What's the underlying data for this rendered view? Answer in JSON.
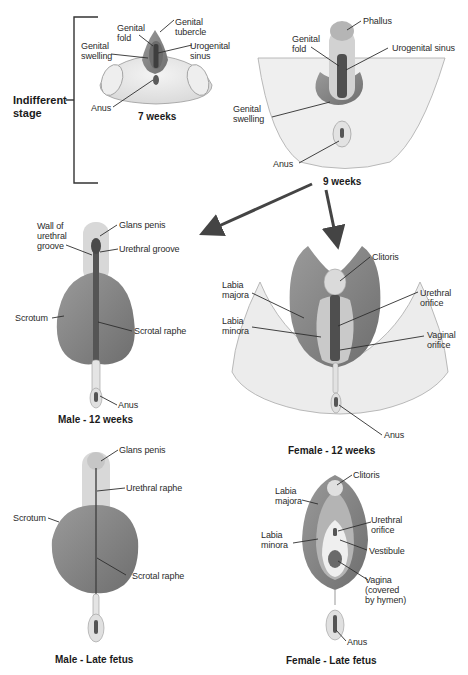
{
  "colors": {
    "background": "#ffffff",
    "skin_light": "#e6e6e6",
    "tissue_mid": "#8a8a8a",
    "tissue_dark": "#5c5c5c",
    "groove": "#3e3e3e",
    "leader_line": "#2e2e2e",
    "text": "#2b2b2b"
  },
  "indifferent_stage": {
    "bracket_label": "Indifferent\nstage",
    "week7": {
      "caption": "7 weeks",
      "labels": {
        "genital_fold": "Genital\nfold",
        "genital_tubercle": "Genital\ntubercle",
        "genital_swelling": "Genital\nswelling",
        "urogenital_sinus": "Urogenital\nsinus",
        "anus": "Anus"
      }
    },
    "week9": {
      "caption": "9 weeks",
      "labels": {
        "phallus": "Phallus",
        "genital_fold": "Genital\nfold",
        "urogenital_sinus": "Urogenital sinus",
        "genital_swelling": "Genital\nswelling",
        "anus": "Anus"
      }
    }
  },
  "male_12_weeks": {
    "caption": "Male - 12 weeks",
    "labels": {
      "glans_penis": "Glans penis",
      "wall_of_urethral_groove": "Wall of\nurethral\ngroove",
      "urethral_groove": "Urethral groove",
      "scrotum": "Scrotum",
      "scrotal_raphe": "Scrotal raphe",
      "anus": "Anus"
    }
  },
  "female_12_weeks": {
    "caption": "Female - 12 weeks",
    "labels": {
      "clitoris": "Clitoris",
      "labia_majora": "Labia\nmajora",
      "labia_minora": "Labia\nminora",
      "urethral_orifice": "Urethral\norifice",
      "vaginal_orifice": "Vaginal\norifice",
      "anus": "Anus"
    }
  },
  "male_late_fetus": {
    "caption": "Male - Late fetus",
    "labels": {
      "glans_penis": "Glans penis",
      "urethral_raphe": "Urethral raphe",
      "scrotum": "Scrotum",
      "scrotal_raphe": "Scrotal raphe"
    }
  },
  "female_late_fetus": {
    "caption": "Female - Late fetus",
    "labels": {
      "clitoris": "Clitoris",
      "labia_majora": "Labia\nmajora",
      "labia_minora": "Labia\nminora",
      "urethral_orifice": "Urethral\norifice",
      "vestibule": "Vestibule",
      "vagina": "Vagina\n(covered\nby hymen)",
      "anus": "Anus"
    }
  }
}
